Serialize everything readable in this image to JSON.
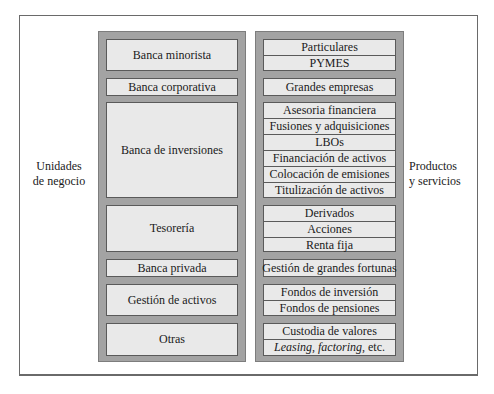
{
  "labels": {
    "left": [
      "Unidades",
      "de negocio"
    ],
    "right": [
      "Productos",
      "y servicios"
    ]
  },
  "business_units": [
    "Banca minorista",
    "Banca corporativa",
    "Banca de inversiones",
    "Tesorería",
    "Banca privada",
    "Gestión de activos",
    "Otras"
  ],
  "products": [
    [
      "Particulares",
      "PYMES"
    ],
    [
      "Grandes empresas"
    ],
    [
      "Asesoria financiera",
      "Fusiones y adquisiciones",
      "LBOs",
      "Financiación de activos",
      "Colocación de emisiones",
      "Titulización de activos"
    ],
    [
      "Derivados",
      "Acciones",
      "Renta fija"
    ],
    [
      "Gestión de grandes fortunas"
    ],
    [
      "Fondos de inversión",
      "Fondos de pensiones"
    ],
    [
      "Custodia de valores"
    ]
  ],
  "last_row": {
    "italic_part": "Leasing, factoring,",
    "normal_part": " etc."
  },
  "colors": {
    "column_bg": "#a3a3a3",
    "box_bg": "#e9e9e9",
    "border": "#5a5a5a"
  }
}
